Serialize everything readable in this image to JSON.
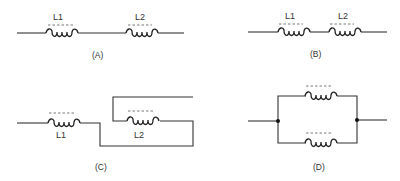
{
  "figure": {
    "panels": [
      {
        "id": "A",
        "caption": "(A)",
        "description": "L1 and L2 in series, spaced apart",
        "inductors": [
          "L1",
          "L2"
        ]
      },
      {
        "id": "B",
        "caption": "(B)",
        "description": "L1 and L2 in series, close together",
        "inductors": [
          "L1",
          "L2"
        ]
      },
      {
        "id": "C",
        "caption": "(C)",
        "description": "L1 in series with L2, L2 winding connected in opposite direction",
        "inductors": [
          "L1",
          "L2"
        ]
      },
      {
        "id": "D",
        "caption": "(D)",
        "description": "Two inductors in parallel",
        "inductors": [
          "",
          ""
        ]
      }
    ],
    "colors": {
      "line": "#333333",
      "background": "#ffffff"
    }
  }
}
